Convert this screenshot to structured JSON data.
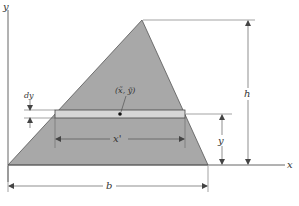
{
  "figure": {
    "type": "centroid-of-triangle",
    "labels": {
      "y_axis": "y",
      "x_axis": "x",
      "strip_thickness": "dy",
      "centroid": "(x̃, ỹ)",
      "strip_length": "x'",
      "strip_height": "y",
      "triangle_height": "h",
      "triangle_base": "b"
    },
    "colors": {
      "triangle_fill": "#a8a8a8",
      "strip_fill": "#d6d6d6",
      "lines": "#444444",
      "background": "#ffffff"
    }
  }
}
